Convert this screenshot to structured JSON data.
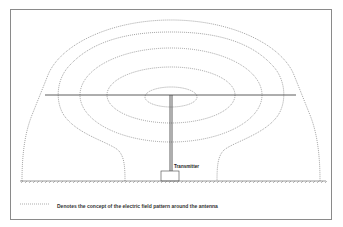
{
  "diagram": {
    "labels": {
      "transmitter": "Transmitter"
    },
    "legend": {
      "symbol": "dotted-line",
      "text": "Denotes the concept of the electric field pattern around the antenna"
    },
    "components": [
      "horizontal-antenna-wire",
      "vertical-feed-wire",
      "transmitter-box",
      "ground-plane",
      "field-lines"
    ],
    "field_line_count": 5,
    "colors": {
      "lines": "#333333",
      "field_lines": "#666666",
      "border": "#8a8a8a"
    }
  }
}
